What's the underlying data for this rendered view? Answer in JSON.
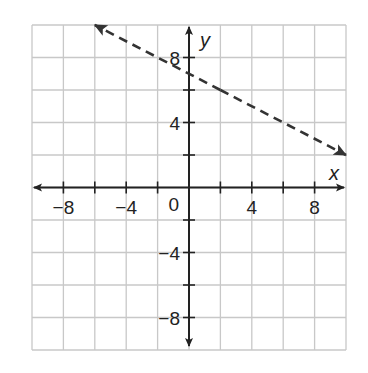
{
  "chart_data": {
    "type": "line",
    "title": "",
    "xlabel": "x",
    "ylabel": "y",
    "xlim": [
      -10,
      10
    ],
    "ylim": [
      -10,
      10
    ],
    "grid": true,
    "grid_step": 2,
    "x_tick_labels": [
      "−8",
      "−4",
      "4",
      "8"
    ],
    "x_tick_values": [
      -8,
      -4,
      4,
      8
    ],
    "y_tick_labels": [
      "8",
      "4",
      "−4",
      "−8"
    ],
    "y_tick_values": [
      8,
      4,
      -4,
      -8
    ],
    "origin_label": "0",
    "series": [
      {
        "name": "dashed line",
        "style": "dashed",
        "arrows": "both",
        "slope": -0.5,
        "intercept": 7,
        "x": [
          -6,
          10
        ],
        "y": [
          10,
          2
        ]
      }
    ]
  },
  "colors": {
    "grid": "#c8c8c8",
    "axis": "#222222",
    "line": "#333333"
  }
}
